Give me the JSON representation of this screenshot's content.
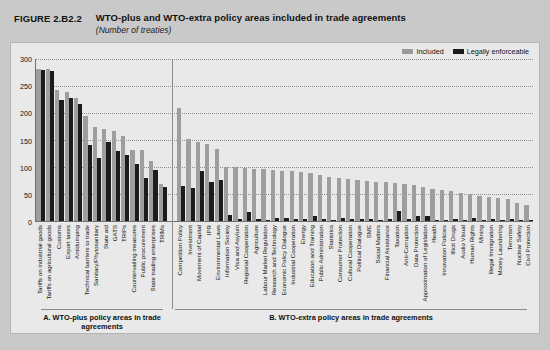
{
  "header": {
    "figure_number": "FIGURE 2.B2.2",
    "title": "WTO-plus and WTO-extra policy areas included in trade agreements",
    "subtitle": "(Number of treaties)"
  },
  "legend": {
    "items": [
      {
        "label": "Included",
        "color": "#9e9e9e"
      },
      {
        "label": "Legally enforceable",
        "color": "#1c1c1c"
      }
    ]
  },
  "sections": {
    "a_label": "A. WTO-plus policy areas in trade agreements",
    "b_label": "B. WTO-extra policy areas in trade agreements"
  },
  "chart_data": {
    "type": "bar",
    "title": "WTO-plus and WTO-extra policy areas included in trade agreements",
    "subtitle": "(Number of treaties)",
    "xlabel": "",
    "ylabel": "Number of treaties",
    "ylim": [
      0,
      300
    ],
    "yticks": [
      0,
      50,
      100,
      150,
      200,
      250,
      300
    ],
    "grid": true,
    "legend_position": "top-right",
    "series": [
      {
        "name": "Included",
        "color": "#9e9e9e"
      },
      {
        "name": "Legally enforceable",
        "color": "#1c1c1c"
      }
    ],
    "panels": [
      {
        "key": "A",
        "label": "A. WTO-plus policy areas in trade agreements",
        "categories": [
          "Tariffs on industrial goods",
          "Tariffs on agricultural goods",
          "Customs",
          "Export taxes",
          "Antidumping",
          "Technical barriers to trade",
          "Sanitary/Phytosanitary",
          "State aid",
          "GATS",
          "TRIPs",
          "Countervailing measures",
          "Public procurement",
          "State trading enterprises",
          "TRIMs"
        ],
        "included": [
          282,
          281,
          243,
          239,
          228,
          195,
          175,
          171,
          167,
          158,
          131,
          131,
          112,
          68
        ],
        "legally_enforceable": [
          279,
          277,
          225,
          228,
          216,
          140,
          117,
          147,
          130,
          123,
          105,
          80,
          95,
          63
        ]
      },
      {
        "key": "B",
        "label": "B. WTO-extra policy areas in trade agreements",
        "categories": [
          "Competition Policy",
          "Investment",
          "Movement of Capital",
          "IPR",
          "Environmental Laws",
          "Information Society",
          "Visa and Asylum",
          "Regional Cooperation",
          "Agriculture",
          "Labour Market Regulation",
          "Research and Technology",
          "Economic Policy Dialogue",
          "Industrial Cooperation",
          "Energy",
          "Education and Training",
          "Public Administration",
          "Statistics",
          "Consumer Protection",
          "Cultural Cooperation",
          "Political Dialogue",
          "SME",
          "Social Matters",
          "Financial Assistance",
          "Taxation",
          "Anti-Corruption",
          "Data Protection",
          "Approximation of Legislation",
          "Health",
          "Innovation Policies",
          "Illicit Drugs",
          "Audio Visual",
          "Human Rights",
          "Mining",
          "Illegal Immigration",
          "Money Laundering",
          "Terrorism",
          "Nuclear Safety",
          "Civil Protection"
        ],
        "included": [
          210,
          151,
          146,
          142,
          133,
          100,
          100,
          99,
          97,
          96,
          94,
          92,
          92,
          90,
          88,
          85,
          82,
          80,
          78,
          76,
          74,
          73,
          72,
          70,
          69,
          66,
          63,
          60,
          58,
          55,
          52,
          50,
          46,
          44,
          42,
          40,
          33,
          30
        ],
        "legally_enforceable": [
          64,
          61,
          92,
          72,
          76,
          12,
          3,
          16,
          4,
          2,
          6,
          5,
          3,
          4,
          10,
          3,
          2,
          6,
          3,
          4,
          3,
          2,
          4,
          18,
          3,
          10,
          9,
          2,
          2,
          3,
          2,
          6,
          2,
          3,
          2,
          3,
          2,
          2
        ]
      }
    ]
  }
}
